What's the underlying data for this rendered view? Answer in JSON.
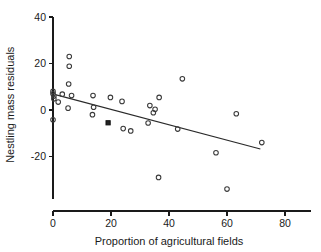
{
  "chart_data": {
    "type": "scatter",
    "title": "",
    "xlabel": "Proportion of agricultural fields",
    "ylabel": "Nestling mass residuals",
    "xlim": [
      -2,
      90
    ],
    "ylim": [
      -38,
      40
    ],
    "xticks": [
      0,
      20,
      40,
      60,
      80
    ],
    "yticks": [
      -20,
      0,
      20,
      40
    ],
    "xtick_labels": [
      "0",
      "20",
      "40",
      "60",
      "80"
    ],
    "ytick_labels": [
      "-20",
      "0",
      "20",
      "40"
    ],
    "grid": false,
    "legend": "none",
    "marker_style": "open-circle",
    "points": [
      {
        "x": 0.0,
        "y": 8.0,
        "style": "open"
      },
      {
        "x": 0.0,
        "y": 7.0,
        "style": "open"
      },
      {
        "x": 0.3,
        "y": 6.0,
        "style": "open"
      },
      {
        "x": 0.3,
        "y": 4.8,
        "style": "open"
      },
      {
        "x": 0.0,
        "y": -4.2,
        "style": "open"
      },
      {
        "x": 1.8,
        "y": 3.4,
        "style": "open"
      },
      {
        "x": 3.2,
        "y": 6.8,
        "style": "open"
      },
      {
        "x": 5.6,
        "y": 23.0,
        "style": "open"
      },
      {
        "x": 5.6,
        "y": 18.8,
        "style": "open"
      },
      {
        "x": 5.4,
        "y": 11.2,
        "style": "open"
      },
      {
        "x": 5.2,
        "y": 0.8,
        "style": "open"
      },
      {
        "x": 6.4,
        "y": 6.2,
        "style": "open"
      },
      {
        "x": 13.8,
        "y": 6.2,
        "style": "open"
      },
      {
        "x": 14.0,
        "y": 1.2,
        "style": "open"
      },
      {
        "x": 13.6,
        "y": -2.0,
        "style": "open"
      },
      {
        "x": 19.0,
        "y": -5.5,
        "style": "filled"
      },
      {
        "x": 19.8,
        "y": 5.4,
        "style": "open"
      },
      {
        "x": 23.8,
        "y": 3.7,
        "style": "open"
      },
      {
        "x": 24.2,
        "y": -8.0,
        "style": "open"
      },
      {
        "x": 26.8,
        "y": -9.0,
        "style": "open"
      },
      {
        "x": 32.8,
        "y": -5.6,
        "style": "open"
      },
      {
        "x": 33.4,
        "y": 1.9,
        "style": "open"
      },
      {
        "x": 34.6,
        "y": -1.2,
        "style": "open"
      },
      {
        "x": 35.2,
        "y": 0.3,
        "style": "open"
      },
      {
        "x": 36.6,
        "y": 5.4,
        "style": "open"
      },
      {
        "x": 36.4,
        "y": -29.0,
        "style": "open"
      },
      {
        "x": 43.0,
        "y": -8.2,
        "style": "open"
      },
      {
        "x": 44.6,
        "y": 13.4,
        "style": "open"
      },
      {
        "x": 56.2,
        "y": -18.4,
        "style": "open"
      },
      {
        "x": 60.0,
        "y": -34.0,
        "style": "open"
      },
      {
        "x": 63.2,
        "y": -1.6,
        "style": "open"
      },
      {
        "x": 72.0,
        "y": -14.0,
        "style": "open"
      }
    ],
    "fit_line": {
      "label": "regression-line",
      "x_start": 0.8,
      "y_start": 6.6,
      "x_end": 71.5,
      "y_end": -16.8
    }
  }
}
